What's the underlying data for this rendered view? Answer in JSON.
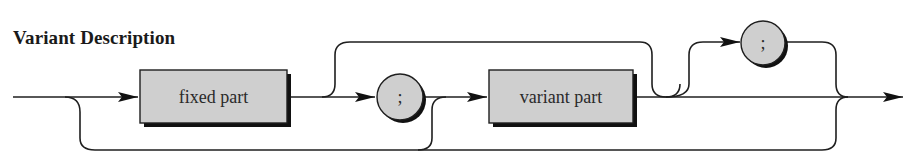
{
  "title": "Variant Description",
  "diagram": {
    "type": "syntax-diagram",
    "nodes": [
      {
        "id": "fixed-part",
        "shape": "box",
        "label": "fixed part"
      },
      {
        "id": "semicolon-1",
        "shape": "circle",
        "label": ";"
      },
      {
        "id": "variant-part",
        "shape": "box",
        "label": "variant part"
      },
      {
        "id": "semicolon-2",
        "shape": "circle",
        "label": ";"
      }
    ],
    "colors": {
      "fill": "#cfcfcf",
      "stroke": "#1f1f1f",
      "shadow": "#111111"
    }
  }
}
